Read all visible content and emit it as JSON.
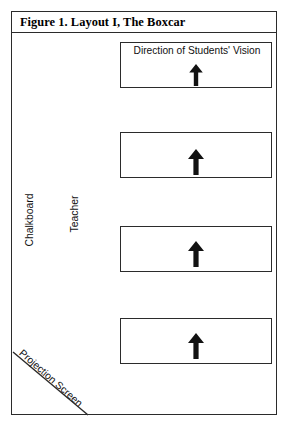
{
  "figure": {
    "title": "Figure 1. Layout I, The Boxcar",
    "background_color": "#ffffff",
    "line_color": "#2b2b2b",
    "text_color": "#111111"
  },
  "labels": {
    "chalkboard": "Chalkboard",
    "teacher": "Teacher",
    "projection_screen": "Projection Screen",
    "vision_direction": "Direction of Students' Vision"
  },
  "rows": [
    {
      "id": "row-1",
      "label": "Direction of Students' Vision",
      "has_label": true,
      "arrow": "up-arrow"
    },
    {
      "id": "row-2",
      "label": "",
      "has_label": false,
      "arrow": "up-arrow"
    },
    {
      "id": "row-3",
      "label": "",
      "has_label": false,
      "arrow": "up-arrow"
    },
    {
      "id": "row-4",
      "label": "",
      "has_label": false,
      "arrow": "up-arrow"
    }
  ],
  "icons": {
    "arrow_up": "up-arrow-icon",
    "diagonal_line": "projection-screen-line"
  }
}
